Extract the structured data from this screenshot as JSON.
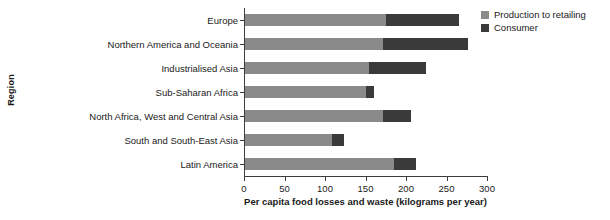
{
  "chart_data": {
    "type": "bar",
    "orientation": "horizontal",
    "stacked": true,
    "title": "",
    "xlabel": "Per capita food losses and waste (kilograms per year)",
    "ylabel": "Region",
    "xlim": [
      0,
      300
    ],
    "xticks": [
      0,
      50,
      100,
      150,
      200,
      250,
      300
    ],
    "xtick_labels": [
      "0",
      "50",
      "100",
      "150",
      "200",
      "250",
      "300"
    ],
    "grid": false,
    "legend_position": "top-right",
    "categories": [
      "Europe",
      "Northern America and Oceania",
      "Industrialised Asia",
      "Sub-Saharan Africa",
      "North Africa, West and Central Asia",
      "South and South-East Asia",
      "Latin America"
    ],
    "series": [
      {
        "name": "Production to retailing",
        "color": "#8a8a8a",
        "values": [
          174,
          170,
          153,
          149,
          170,
          108,
          184
        ]
      },
      {
        "name": "Consumer",
        "color": "#3a3a3a",
        "values": [
          90,
          105,
          70,
          10,
          35,
          14,
          27
        ]
      }
    ],
    "totals": [
      264,
      275,
      223,
      159,
      205,
      122,
      211
    ]
  },
  "legend": {
    "items": [
      {
        "label": "Production to retailing",
        "swatch": "#8a8a8a"
      },
      {
        "label": "Consumer",
        "swatch": "#3a3a3a"
      }
    ]
  }
}
